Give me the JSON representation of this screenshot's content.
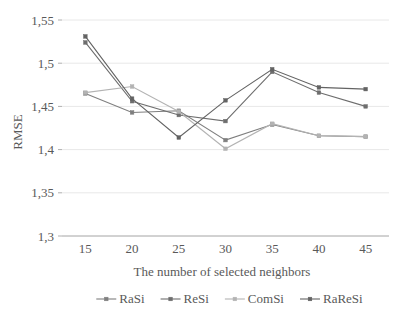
{
  "chart_data": {
    "type": "line",
    "title": "",
    "xlabel": "The number of selected neighbors",
    "ylabel": "RMSE",
    "x": [
      15,
      20,
      25,
      30,
      35,
      40,
      45
    ],
    "xticklabels": [
      "15",
      "20",
      "25",
      "30",
      "35",
      "40",
      "45"
    ],
    "yticklabels": [
      "1,3",
      "1,35",
      "1,4",
      "1,45",
      "1,5",
      "1,55"
    ],
    "yticks": [
      1.3,
      1.35,
      1.4,
      1.45,
      1.5,
      1.55
    ],
    "ylim": [
      1.3,
      1.55
    ],
    "xlim": [
      12.5,
      47.5
    ],
    "grid": "horizontal",
    "legend_position": "bottom",
    "series": [
      {
        "name": "RaSi",
        "color": "#7f7f7f",
        "marker": "square",
        "values": [
          1.465,
          1.443,
          1.445,
          1.411,
          1.429,
          1.416,
          1.415
        ]
      },
      {
        "name": "ReSi",
        "color": "#6e6e6e",
        "marker": "square",
        "values": [
          1.524,
          1.456,
          1.44,
          1.433,
          1.49,
          1.466,
          1.45
        ]
      },
      {
        "name": "ComSi",
        "color": "#b3b3b3",
        "marker": "square",
        "values": [
          1.466,
          1.473,
          1.444,
          1.401,
          1.43,
          1.416,
          1.415
        ]
      },
      {
        "name": "RaReSi",
        "color": "#636363",
        "marker": "square",
        "values": [
          1.531,
          1.459,
          1.414,
          1.457,
          1.493,
          1.472,
          1.47
        ]
      }
    ]
  },
  "legend": {
    "items": [
      {
        "label": "RaSi"
      },
      {
        "label": "ReSi"
      },
      {
        "label": "ComSi"
      },
      {
        "label": "RaReSi"
      }
    ]
  },
  "axes": {
    "y_title": "RMSE",
    "x_title": "The number of selected neighbors"
  },
  "colors": {
    "grid": "#e8e8e8",
    "axis": "#b0b0b0",
    "text": "#595959",
    "background": "#ffffff"
  }
}
